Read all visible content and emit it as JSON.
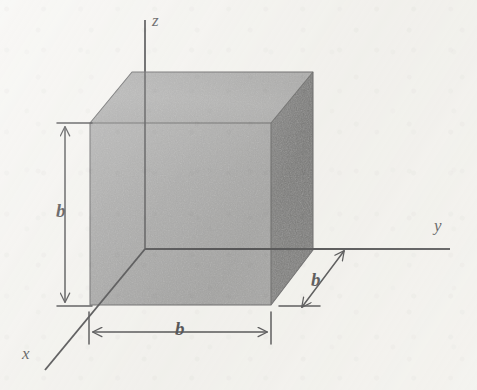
{
  "figure": {
    "type": "3d-cube-axes-diagram",
    "background_color": "#f2f1ed",
    "ink_color": "#17171a",
    "axes": [
      {
        "name": "z",
        "label": "z",
        "orientation": "vertical-up",
        "from": [
          145,
          249
        ],
        "to": [
          145,
          20
        ]
      },
      {
        "name": "y",
        "label": "y",
        "orientation": "horizontal-right",
        "from": [
          145,
          249
        ],
        "to": [
          450,
          249
        ]
      },
      {
        "name": "x",
        "label": "x",
        "orientation": "diagonal-down-left",
        "from": [
          145,
          249
        ],
        "to": [
          45,
          370
        ]
      }
    ],
    "cube": {
      "edge_label": "b",
      "front_face": {
        "name": "front-face",
        "fill": "#8a8a8a",
        "points": "90,123 271,123 271,305 90,305"
      },
      "top_face": {
        "name": "top-face",
        "fill": "#8e8e8e",
        "points": "90,123 132,72 313,72 271,123"
      },
      "right_face": {
        "name": "right-face",
        "fill": "#4b4b4b",
        "points": "271,123 313,72 313,250 271,305"
      }
    },
    "dimensions": [
      {
        "name": "height-dimension",
        "label": "b",
        "axis": "z",
        "from": [
          65,
          125
        ],
        "to": [
          65,
          305
        ]
      },
      {
        "name": "width-dimension",
        "label": "b",
        "axis": "x",
        "from": [
          89,
          332
        ],
        "to": [
          271,
          332
        ]
      },
      {
        "name": "depth-dimension",
        "label": "b",
        "axis": "y",
        "from": [
          303,
          306
        ],
        "to": [
          344,
          250
        ]
      }
    ]
  }
}
